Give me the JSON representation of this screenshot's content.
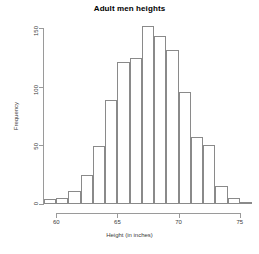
{
  "chart_data": {
    "type": "bar",
    "title": "Adult men heights",
    "xlabel": "Height (in inches)",
    "ylabel": "Frequency",
    "grid": false,
    "legend": null,
    "bin_width": 1,
    "xlim": [
      59,
      76
    ],
    "ylim": [
      0,
      155
    ],
    "yticks": [
      0,
      50,
      100,
      150
    ],
    "ytick_labels": [
      "0",
      "50",
      "100",
      "150"
    ],
    "xticks": [
      60,
      65,
      70,
      75
    ],
    "xtick_labels": [
      "60",
      "65",
      "70",
      "75"
    ],
    "categories": [
      "59-60",
      "60-61",
      "61-62",
      "62-63",
      "63-64",
      "64-65",
      "65-66",
      "66-67",
      "67-68",
      "68-69",
      "69-70",
      "70-71",
      "71-72",
      "72-73",
      "73-74",
      "74-75",
      "75-76"
    ],
    "bin_starts": [
      59,
      60,
      61,
      62,
      63,
      64,
      65,
      66,
      67,
      68,
      69,
      70,
      71,
      72,
      73,
      74,
      75
    ],
    "bin_ends": [
      60,
      61,
      62,
      63,
      64,
      65,
      66,
      67,
      68,
      69,
      70,
      71,
      72,
      73,
      74,
      75,
      76
    ],
    "values": [
      4,
      5,
      11,
      25,
      49,
      89,
      121,
      124,
      152,
      143,
      131,
      95,
      57,
      50,
      15,
      5,
      2
    ]
  },
  "style": {
    "bar_stroke": "#8a8a8a",
    "bar_fill": "#ffffff",
    "axis_color": "#9a9a9a",
    "text_color": "#3a3a3a",
    "title_color": "#000000",
    "background": "#ffffff"
  }
}
